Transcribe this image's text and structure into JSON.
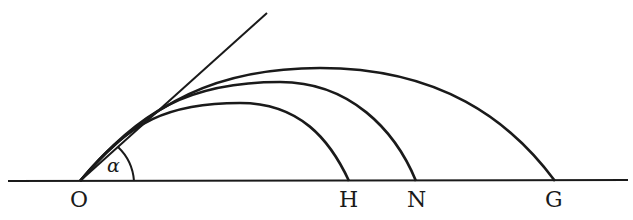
{
  "diagram": {
    "type": "projectile-trajectories",
    "ink_color": "#1a1a1a",
    "background": "#ffffff",
    "angle_label": "α",
    "points": [
      {
        "id": "O",
        "label": "O"
      },
      {
        "id": "H",
        "label": "H"
      },
      {
        "id": "N",
        "label": "N"
      },
      {
        "id": "G",
        "label": "G"
      }
    ],
    "trajectories": [
      {
        "name": "trajectory-to-H",
        "lands_at": "H"
      },
      {
        "name": "trajectory-to-N",
        "lands_at": "N"
      },
      {
        "name": "trajectory-to-G",
        "lands_at": "G"
      }
    ],
    "launch_direction": "straight line from O at angle α above the ground line"
  }
}
